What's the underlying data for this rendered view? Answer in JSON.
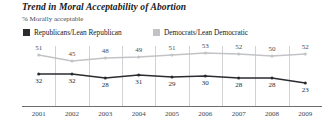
{
  "title": "Trend in Moral Acceptability of Abortion",
  "subtitle": "% Morally acceptable",
  "legend": {
    "republican_label": "Republicans/Lean Republican",
    "democrat_label": "Democrats/Lean Democratic",
    "republican_color": "#2b2c30",
    "democrat_color": "#c2c3c6"
  },
  "chart_data": {
    "type": "line",
    "title": "Trend in Moral Acceptability of Abortion",
    "subtitle": "% Morally acceptable",
    "xlabel": "",
    "ylabel": "% Morally acceptable",
    "categories": [
      "2001",
      "2002",
      "2003",
      "2004",
      "2005",
      "2006",
      "2007",
      "2008",
      "2009"
    ],
    "ylim": [
      0,
      60
    ],
    "grid": true,
    "legend_position": "top-left",
    "series": [
      {
        "name": "Democrats/Lean Democratic",
        "color": "#c2c3c6",
        "values": [
          51,
          45,
          48,
          49,
          51,
          53,
          52,
          50,
          52
        ]
      },
      {
        "name": "Republicans/Lean Republican",
        "color": "#2b2c30",
        "values": [
          32,
          32,
          28,
          31,
          29,
          30,
          28,
          28,
          23
        ]
      }
    ]
  }
}
